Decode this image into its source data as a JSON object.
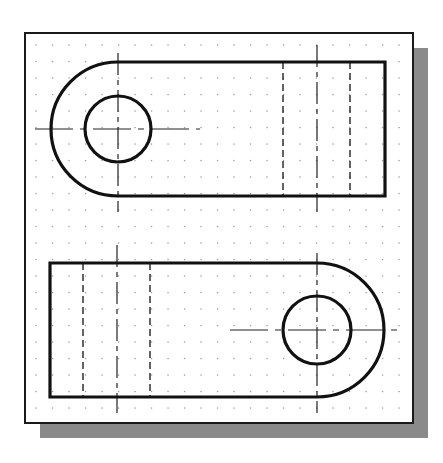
{
  "figure": {
    "colors": {
      "background": "#ffffff",
      "paper": "#ffffff",
      "frame": "#1a1a1a",
      "shadow": "#8a8a8a",
      "grid_dot": "#9a9a9a",
      "object_line": "#111111",
      "hidden_line": "#222222",
      "center_line": "#222222"
    },
    "frame": {
      "x": 25,
      "y": 33,
      "w": 388,
      "h": 390,
      "shadow_offset": 15
    },
    "grid": {
      "start_x": 36,
      "start_y": 45,
      "spacing": 16.5,
      "cols": 23,
      "rows": 23
    }
  },
  "views": [
    {
      "name": "top-view",
      "rounded_end": "left",
      "body": {
        "x_straight_start": 118,
        "x_right": 385,
        "y_top": 62,
        "y_bottom": 196
      },
      "arc_center": {
        "x": 118,
        "y": 129
      },
      "arc_radius": 67,
      "hole_radius": 33,
      "hidden_lines_x": [
        283,
        350
      ],
      "vertical_centerline": {
        "x": 317,
        "y1": 45,
        "y2": 212
      },
      "hole_vertical_centerline": {
        "x": 118,
        "y1": 53,
        "y2": 212
      },
      "hole_horizontal_centerline": {
        "y": 129,
        "x1": 35,
        "x2": 200
      }
    },
    {
      "name": "bottom-view",
      "rounded_end": "right",
      "body": {
        "x_left": 50,
        "x_straight_end": 317,
        "y_top": 263,
        "y_bottom": 397
      },
      "arc_center": {
        "x": 317,
        "y": 330
      },
      "arc_radius": 67,
      "hole_radius": 34,
      "hidden_lines_x": [
        83,
        150
      ],
      "vertical_centerline": {
        "x": 117,
        "y1": 245,
        "y2": 413
      },
      "hole_vertical_centerline": {
        "x": 317,
        "y1": 253,
        "y2": 413
      },
      "hole_horizontal_centerline": {
        "y": 330,
        "x1": 230,
        "x2": 400
      }
    }
  ]
}
